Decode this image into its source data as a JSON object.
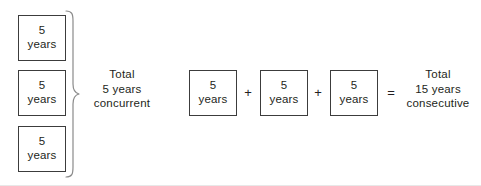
{
  "diagram": {
    "title_text_present": false,
    "concurrent_group": {
      "boxes": [
        {
          "number": "5",
          "unit": "years"
        },
        {
          "number": "5",
          "unit": "years"
        },
        {
          "number": "5",
          "unit": "years"
        }
      ],
      "brace_icon": "right-curly-brace-icon",
      "caption_lines": [
        "Total",
        "5 years",
        "concurrent"
      ]
    },
    "consecutive_group": {
      "boxes": [
        {
          "number": "5",
          "unit": "years"
        },
        {
          "number": "5",
          "unit": "years"
        },
        {
          "number": "5",
          "unit": "years"
        }
      ],
      "operators": [
        "+",
        "+",
        "="
      ],
      "caption_lines": [
        "Total",
        "15 years",
        "consecutive"
      ]
    },
    "colors": {
      "box_border": "#3c3c3c",
      "text": "#231f20",
      "background": "#ffffff",
      "brace_stroke": "#8a8a8a",
      "bottom_rule": "#e8e8e8"
    }
  }
}
